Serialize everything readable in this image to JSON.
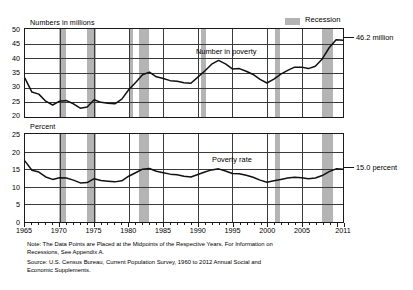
{
  "chart_data": [
    {
      "type": "line",
      "id": "number-in-poverty",
      "title": "Numbers in millions",
      "ylabel": "Numbers in millions",
      "xlabel": "",
      "ylim": [
        20,
        50
      ],
      "yticks": [
        20,
        25,
        30,
        35,
        40,
        45,
        50
      ],
      "xlim": [
        1965,
        2011
      ],
      "xticks": [
        1965,
        1970,
        1975,
        1980,
        1985,
        1990,
        1995,
        2000,
        2005,
        2011
      ],
      "grid": true,
      "legend": "Recession",
      "series_label": "Number in poverty",
      "end_annotation": "46.2 million",
      "x": [
        1965,
        1966,
        1967,
        1968,
        1969,
        1970,
        1971,
        1972,
        1973,
        1974,
        1975,
        1976,
        1977,
        1978,
        1979,
        1980,
        1981,
        1982,
        1983,
        1984,
        1985,
        1986,
        1987,
        1988,
        1989,
        1990,
        1991,
        1992,
        1993,
        1994,
        1995,
        1996,
        1997,
        1998,
        1999,
        2000,
        2001,
        2002,
        2003,
        2004,
        2005,
        2006,
        2007,
        2008,
        2009,
        2010,
        2011
      ],
      "values": [
        33.2,
        28.5,
        27.8,
        25.4,
        24.1,
        25.4,
        25.6,
        24.5,
        23.0,
        23.4,
        25.9,
        25.0,
        24.7,
        24.5,
        26.1,
        29.3,
        31.8,
        34.4,
        35.3,
        33.7,
        33.1,
        32.4,
        32.2,
        31.7,
        31.5,
        33.6,
        35.7,
        38.0,
        39.3,
        38.1,
        36.4,
        36.5,
        35.6,
        34.5,
        32.8,
        31.6,
        32.9,
        34.6,
        35.9,
        37.0,
        37.0,
        36.5,
        37.3,
        39.8,
        43.6,
        46.3,
        46.2
      ],
      "recessions": [
        {
          "start": 1969.9,
          "end": 1970.9
        },
        {
          "start": 1973.9,
          "end": 1975.2
        },
        {
          "start": 1980.0,
          "end": 1980.6
        },
        {
          "start": 1981.5,
          "end": 1982.9
        },
        {
          "start": 1990.5,
          "end": 1991.2
        },
        {
          "start": 2001.2,
          "end": 2001.9
        },
        {
          "start": 2007.9,
          "end": 2009.5
        }
      ]
    },
    {
      "type": "line",
      "id": "poverty-rate",
      "title": "Percent",
      "ylabel": "Percent",
      "xlabel": "",
      "ylim": [
        0,
        25
      ],
      "yticks": [
        0,
        5,
        10,
        15,
        20,
        25
      ],
      "xlim": [
        1965,
        2011
      ],
      "xticks": [
        1965,
        1970,
        1975,
        1980,
        1985,
        1990,
        1995,
        2000,
        2005,
        2011
      ],
      "grid": true,
      "legend": "Recession",
      "series_label": "Poverty rate",
      "end_annotation": "15.0 percent",
      "x": [
        1965,
        1966,
        1967,
        1968,
        1969,
        1970,
        1971,
        1972,
        1973,
        1974,
        1975,
        1976,
        1977,
        1978,
        1979,
        1980,
        1981,
        1982,
        1983,
        1984,
        1985,
        1986,
        1987,
        1988,
        1989,
        1990,
        1991,
        1992,
        1993,
        1994,
        1995,
        1996,
        1997,
        1998,
        1999,
        2000,
        2001,
        2002,
        2003,
        2004,
        2005,
        2006,
        2007,
        2008,
        2009,
        2010,
        2011
      ],
      "values": [
        17.3,
        14.7,
        14.2,
        12.8,
        12.1,
        12.6,
        12.5,
        11.9,
        11.1,
        11.2,
        12.3,
        11.8,
        11.6,
        11.4,
        11.7,
        13.0,
        14.0,
        15.0,
        15.2,
        14.4,
        14.0,
        13.6,
        13.4,
        13.0,
        12.8,
        13.5,
        14.2,
        14.8,
        15.1,
        14.5,
        13.8,
        13.7,
        13.3,
        12.7,
        11.9,
        11.3,
        11.7,
        12.1,
        12.5,
        12.7,
        12.6,
        12.3,
        12.5,
        13.2,
        14.3,
        15.1,
        15.0
      ],
      "recessions": [
        {
          "start": 1969.9,
          "end": 1970.9
        },
        {
          "start": 1973.9,
          "end": 1975.2
        },
        {
          "start": 1981.5,
          "end": 1982.9
        },
        {
          "start": 2001.2,
          "end": 2001.9
        },
        {
          "start": 2007.9,
          "end": 2009.5
        }
      ]
    }
  ],
  "legend": {
    "recession_label": "Recession"
  },
  "top_chart": {
    "axis_title": "Numbers in millions",
    "series_label": "Number in poverty",
    "end_value_label": "46.2 million",
    "yticks": [
      "50",
      "45",
      "40",
      "35",
      "30",
      "25",
      "20"
    ]
  },
  "bottom_chart": {
    "axis_title": "Percent",
    "series_label": "Poverty rate",
    "end_value_label": "15.0 percent",
    "yticks": [
      "25",
      "20",
      "15",
      "10",
      "5",
      "0"
    ]
  },
  "xaxis": {
    "ticks": [
      "1965",
      "1970",
      "1975",
      "1980",
      "1985",
      "1990",
      "1995",
      "2000",
      "2005",
      "2011"
    ]
  },
  "footnote": {
    "line1": "Note:  The Data Points are Placed at the Midpoints of the Respective Years. For Information on",
    "line2": "Recessions, See Appendix A.",
    "line3": "Source:  U.S. Census Bureau, Current Population Survey, 1960 to 2012 Annual Social and",
    "line4": "Economic Supplements."
  },
  "colors": {
    "recession_band": "#b4b4b4",
    "line": "#111111",
    "grid": "#3a3a3a",
    "axis": "#1a1a1a"
  }
}
